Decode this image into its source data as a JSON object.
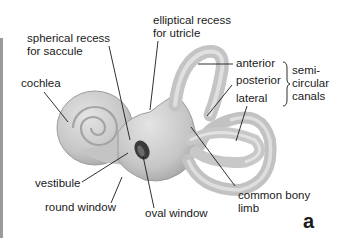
{
  "labels": {
    "spherical_recess": [
      "spherical recess",
      "for saccule"
    ],
    "elliptical_recess": [
      "elliptical recess",
      "for utricle"
    ],
    "cochlea": "cochlea",
    "anterior": "anterior",
    "posterior": "posterior",
    "lateral": "lateral",
    "semicircular_canals": [
      "semi-",
      "circular",
      "canals"
    ],
    "vestibule": "vestibule",
    "round_window": "round window",
    "oval_window": "oval window",
    "common_bony_limb": [
      "common bony",
      "limb"
    ]
  },
  "panel_letter": "a",
  "colors": {
    "bone_fill": "#c9c9c9",
    "bone_shade": "#a8a8a8",
    "bone_light": "#e2e2e2",
    "leader_line": "#1a1a1a",
    "window_dark": "#3a3a3a"
  }
}
